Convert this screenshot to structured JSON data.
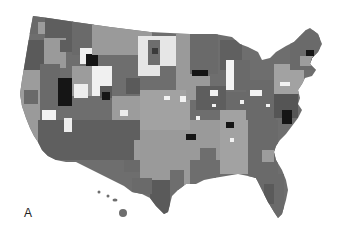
{
  "figure": {
    "panel_label": "A",
    "type": "choropleth-map",
    "region": "United States (contiguous + Hawaii)",
    "color_scale": {
      "white": "#f2f2f2",
      "light": "#bdbdbd",
      "medium": "#9a9a9a",
      "dark": "#6e6e6e",
      "darker": "#555555",
      "black": "#151515"
    },
    "outline_color": "#7a7a7a"
  }
}
